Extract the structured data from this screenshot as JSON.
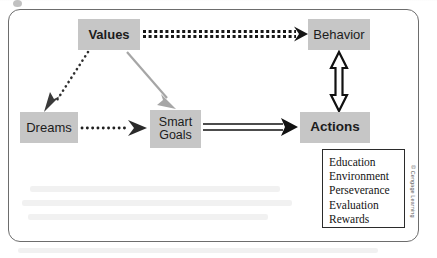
{
  "figure": {
    "type": "flow-diagram",
    "frame": {
      "border_color": "#6d6d6d",
      "shape": "rounded-rectangle"
    },
    "node_fill": "#c6c6c6"
  },
  "nodes": {
    "values": {
      "label": "Values",
      "bold": true,
      "x": 78,
      "y": 19,
      "w": 62,
      "h": 31
    },
    "behavior": {
      "label": "Behavior",
      "bold": false,
      "x": 308,
      "y": 19,
      "w": 62,
      "h": 31
    },
    "dreams": {
      "label": "Dreams",
      "bold": false,
      "x": 20,
      "y": 112,
      "w": 58,
      "h": 31
    },
    "smart": {
      "label_line1": "Smart",
      "label_line2": "Goals",
      "bold": false,
      "x": 150,
      "y": 110,
      "w": 51,
      "h": 38
    },
    "actions": {
      "label": "Actions",
      "bold": true,
      "x": 300,
      "y": 112,
      "w": 70,
      "h": 31
    }
  },
  "edges": [
    {
      "name": "values-to-behavior",
      "from": "values",
      "to": "behavior",
      "style": "thick-dotted",
      "color": "#1a1a1a",
      "direction": "one-way"
    },
    {
      "name": "values-to-dreams",
      "from": "values",
      "to": "dreams",
      "style": "dotted",
      "color": "#3a3a3a",
      "direction": "one-way"
    },
    {
      "name": "values-to-smart",
      "from": "values",
      "to": "smart",
      "style": "solid",
      "color": "#a0a0a0",
      "direction": "one-way"
    },
    {
      "name": "dreams-to-smart",
      "from": "dreams",
      "to": "smart",
      "style": "dotted",
      "color": "#262626",
      "direction": "one-way"
    },
    {
      "name": "smart-to-actions",
      "from": "smart",
      "to": "actions",
      "style": "double-line",
      "color": "#111111",
      "direction": "one-way"
    },
    {
      "name": "behavior-actions",
      "from": "behavior",
      "to": "actions",
      "style": "outlined",
      "color": "#111111",
      "direction": "two-way"
    }
  ],
  "list_box": {
    "name": "factors-list",
    "items": [
      "Education",
      "Environment",
      "Perseverance",
      "Evaluation",
      "Rewards"
    ]
  },
  "credit": {
    "text": "© Cengage Learning"
  }
}
